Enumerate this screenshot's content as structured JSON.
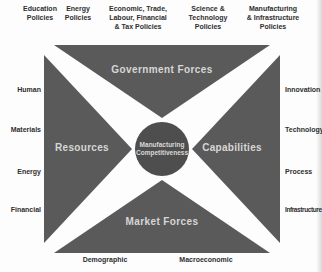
{
  "colors": {
    "triangle_fill": "#5a5a5a",
    "circle_fill": "#4e4e4e",
    "quadrant_text": "#d6d6d6",
    "outer_text": "#2f2f2f",
    "background": "#fdfdfd"
  },
  "top_policies": [
    "Education\nPolicies",
    "Energy\nPolicies",
    "Economic, Trade,\nLabour, Financial\n& Tax Policies",
    "Science &\nTechnology\nPolicies",
    "Manufacturing\n& Infrastructure\nPolicies"
  ],
  "left_resources": [
    "Human",
    "Materials",
    "Energy",
    "Financial"
  ],
  "right_capabilities": [
    "Innovation",
    "Technology",
    "Process",
    "Infrastructure"
  ],
  "bottom_factors": [
    "Demographic",
    "Macroeconomic"
  ],
  "quadrants": {
    "top": "Government Forces",
    "left": "Resources",
    "right": "Capabilities",
    "bottom": "Market Forces"
  },
  "center": {
    "label": "Manufacturing\nCompetitiveness"
  }
}
